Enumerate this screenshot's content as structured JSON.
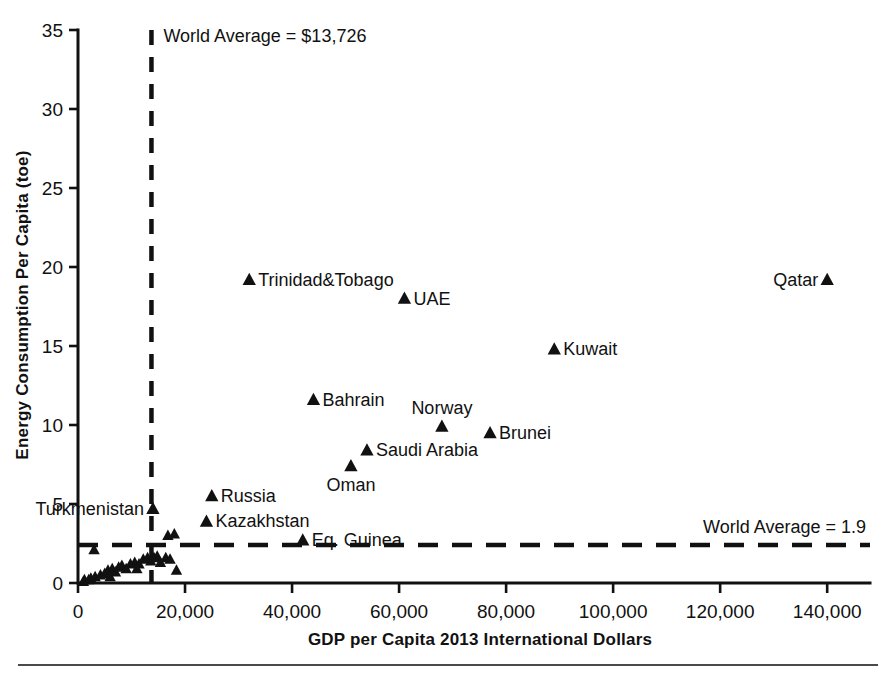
{
  "chart_data": {
    "type": "scatter",
    "title": "",
    "xlabel": "GDP per Capita 2013 International  Dollars",
    "ylabel": "Energy Consumption Per Capita (toe)",
    "xlim": [
      0,
      148000
    ],
    "ylim": [
      0,
      35
    ],
    "xticks": [
      0,
      20000,
      40000,
      60000,
      80000,
      100000,
      120000,
      140000
    ],
    "xticklabels": [
      "0",
      "20,000",
      "40,000",
      "60,000",
      "80,000",
      "100,000",
      "120,000",
      "140,000"
    ],
    "yticks": [
      0,
      5,
      10,
      15,
      20,
      25,
      30,
      35
    ],
    "yticklabels": [
      "0",
      "5",
      "10",
      "15",
      "20",
      "25",
      "30",
      "35"
    ],
    "grid": false,
    "legend": false,
    "marker": "triangle",
    "marker_color": "#111111",
    "annotations": [
      {
        "name": "world-average-gdp",
        "text": "World Average = $13,726",
        "orientation": "vertical",
        "value": 13726,
        "style": "dashed"
      },
      {
        "name": "world-average-energy",
        "text": "World Average = 1.9",
        "orientation": "horizontal",
        "value": 1.9,
        "style": "dashed"
      }
    ],
    "labeled_points": [
      {
        "label": "Trinidad&Tobago",
        "x": 32000,
        "y": 19.2,
        "label_side": "right"
      },
      {
        "label": "UAE",
        "x": 61000,
        "y": 18.0,
        "label_side": "right"
      },
      {
        "label": "Qatar",
        "x": 140000,
        "y": 19.2,
        "label_side": "left"
      },
      {
        "label": "Kuwait",
        "x": 89000,
        "y": 14.8,
        "label_side": "right"
      },
      {
        "label": "Bahrain",
        "x": 44000,
        "y": 11.6,
        "label_side": "right"
      },
      {
        "label": "Norway",
        "x": 68000,
        "y": 9.9,
        "label_side": "above"
      },
      {
        "label": "Brunei",
        "x": 77000,
        "y": 9.5,
        "label_side": "right"
      },
      {
        "label": "Saudi Arabia",
        "x": 54000,
        "y": 8.4,
        "label_side": "right"
      },
      {
        "label": "Oman",
        "x": 51000,
        "y": 7.4,
        "label_side": "below"
      },
      {
        "label": "Russia",
        "x": 25000,
        "y": 5.5,
        "label_side": "right"
      },
      {
        "label": "Turkmenistan",
        "x": 14000,
        "y": 4.7,
        "label_side": "left"
      },
      {
        "label": "Kazakhstan",
        "x": 24000,
        "y": 3.9,
        "label_side": "right"
      },
      {
        "label": "Eq. Guinea",
        "x": 42000,
        "y": 2.7,
        "label_side": "right"
      }
    ],
    "unlabeled_points": [
      {
        "x": 1200,
        "y": 0.2
      },
      {
        "x": 2400,
        "y": 0.3
      },
      {
        "x": 3200,
        "y": 0.4
      },
      {
        "x": 4200,
        "y": 0.5
      },
      {
        "x": 5000,
        "y": 0.6
      },
      {
        "x": 5600,
        "y": 0.8
      },
      {
        "x": 6400,
        "y": 0.9
      },
      {
        "x": 7000,
        "y": 0.7
      },
      {
        "x": 7600,
        "y": 1.0
      },
      {
        "x": 8200,
        "y": 1.1
      },
      {
        "x": 9000,
        "y": 0.9
      },
      {
        "x": 9800,
        "y": 1.2
      },
      {
        "x": 10600,
        "y": 1.3
      },
      {
        "x": 11400,
        "y": 1.2
      },
      {
        "x": 12200,
        "y": 1.5
      },
      {
        "x": 13000,
        "y": 1.6
      },
      {
        "x": 13600,
        "y": 1.4
      },
      {
        "x": 14200,
        "y": 1.6
      },
      {
        "x": 14800,
        "y": 1.7
      },
      {
        "x": 15400,
        "y": 1.3
      },
      {
        "x": 16400,
        "y": 1.6
      },
      {
        "x": 17200,
        "y": 1.5
      },
      {
        "x": 16800,
        "y": 3.0
      },
      {
        "x": 18000,
        "y": 3.1
      },
      {
        "x": 18400,
        "y": 0.8
      },
      {
        "x": 3000,
        "y": 2.1
      },
      {
        "x": 1000,
        "y": 0.1
      },
      {
        "x": 2000,
        "y": 0.2
      },
      {
        "x": 6000,
        "y": 0.4
      },
      {
        "x": 11000,
        "y": 0.9
      }
    ]
  },
  "axis": {
    "x_title": "GDP per Capita 2013 International  Dollars",
    "y_title": "Energy Consumption Per Capita (toe)"
  }
}
